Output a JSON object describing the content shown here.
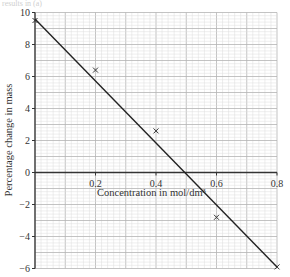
{
  "header": {
    "fragment_text": "results in (a)"
  },
  "colors": {
    "grid_minor": "#dcdcdc",
    "grid_major": "#b4b4b4",
    "axis": "#333333",
    "line": "#222222",
    "marker": "#333333"
  },
  "chart_data": {
    "type": "scatter",
    "title": "",
    "xlabel": "Concentration in mol/dm³",
    "ylabel": "Percentage change in mass",
    "xlim": [
      0,
      0.8
    ],
    "ylim": [
      -6,
      10
    ],
    "x_ticks": [
      0.2,
      0.4,
      0.6,
      0.8
    ],
    "x_tick_labels": [
      "0.2",
      "0.4",
      "0.6",
      "0.8"
    ],
    "y_ticks": [
      10,
      8,
      6,
      4,
      2,
      0,
      -2,
      -4,
      -6
    ],
    "y_tick_labels": [
      "10",
      "8",
      "6",
      "4",
      "2",
      "0",
      "−2",
      "−4",
      "−6"
    ],
    "grid": true,
    "legend": null,
    "series": [
      {
        "name": "Measured points",
        "marker": "x",
        "x": [
          0.0,
          0.2,
          0.4,
          0.6,
          0.8
        ],
        "y": [
          9.5,
          6.4,
          2.6,
          -2.8,
          -5.9
        ]
      },
      {
        "name": "Line of best fit",
        "type": "line",
        "x": [
          0.0,
          0.8
        ],
        "y": [
          9.6,
          -5.9
        ]
      }
    ],
    "annotations": [
      "Line crosses 0 at approximately 0.5 mol/dm³"
    ]
  }
}
